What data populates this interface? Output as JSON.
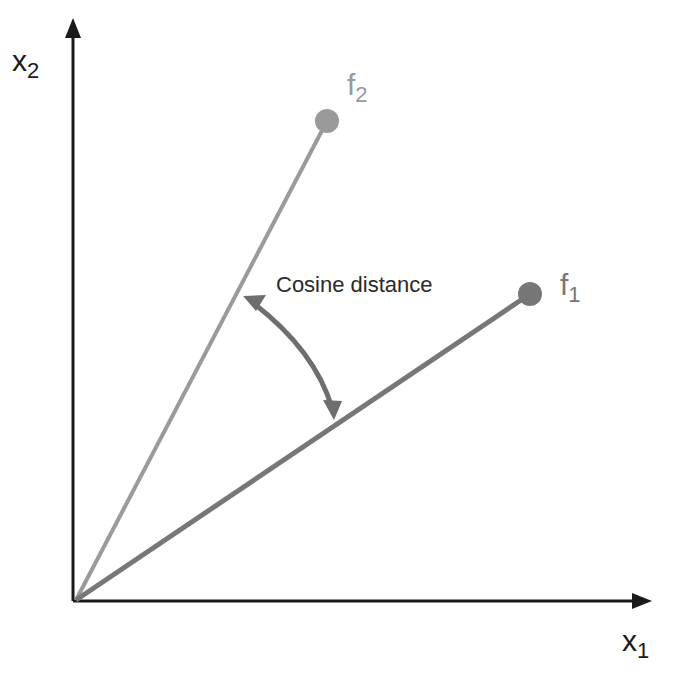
{
  "diagram": {
    "axes": {
      "x_label": "x",
      "x_sub": "1",
      "y_label": "x",
      "y_sub": "2"
    },
    "vectors": [
      {
        "name": "f",
        "sub": "1",
        "color": "#777777"
      },
      {
        "name": "f",
        "sub": "2",
        "color": "#9a9a9a"
      }
    ],
    "annotation": "Cosine distance",
    "colors": {
      "axis": "#1a1a1a",
      "arrow": "#6e6e6e",
      "text": "#2a2a2a"
    }
  }
}
